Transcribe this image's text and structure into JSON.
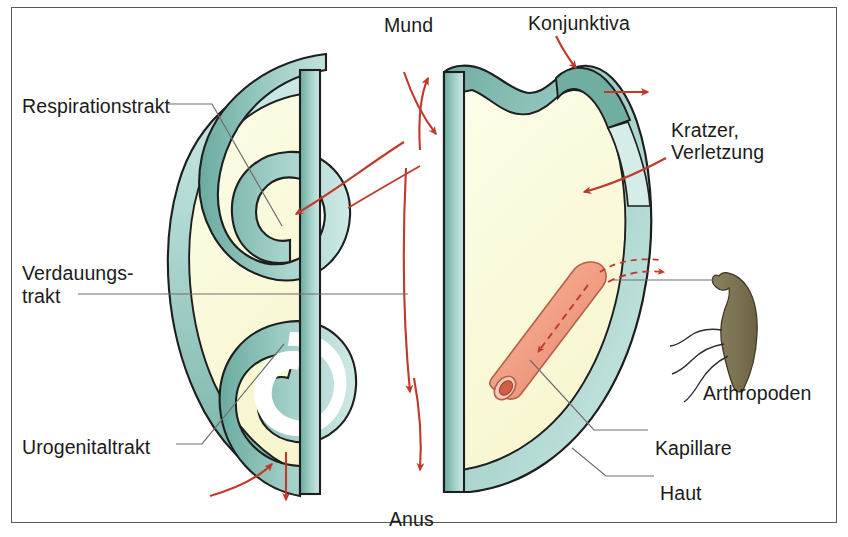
{
  "figure": {
    "type": "anatomical-schematic",
    "background_color": "#ffffff",
    "frame_color": "#58585a"
  },
  "palette": {
    "membrane_light": "#bfe0dc",
    "membrane_mid": "#9ccdc6",
    "membrane_dark": "#6aab9f",
    "body_interior": "#fbfbdc",
    "outline": "#1e1e1e",
    "arrow_red": "#c0392b",
    "capillary_pink": "#f3a289",
    "capillary_dark": "#c9503c",
    "arthropod_body": "#7d7453",
    "leader_line": "#6e6e70",
    "text": "#1b1b1b"
  },
  "labels": {
    "respirationstrakt": {
      "text": "Respirationstrakt",
      "x": 22,
      "y": 95
    },
    "verdauungstrakt_line1": {
      "text": "Verdauungs-",
      "x": 22,
      "y": 262
    },
    "verdauungstrakt_line2": {
      "text": "trakt",
      "x": 22,
      "y": 285
    },
    "urogenitaltrakt": {
      "text": "Urogenitaltrakt",
      "x": 22,
      "y": 436
    },
    "mund": {
      "text": "Mund",
      "x": 384,
      "y": 14
    },
    "konjunktiva": {
      "text": "Konjunktiva",
      "x": 528,
      "y": 12
    },
    "kratzer_line1": {
      "text": "Kratzer,",
      "x": 671,
      "y": 119
    },
    "kratzer_line2": {
      "text": "Verletzung",
      "x": 671,
      "y": 141
    },
    "arthropoden": {
      "text": "Arthropoden",
      "x": 703,
      "y": 382
    },
    "kapillare": {
      "text": "Kapillare",
      "x": 655,
      "y": 437
    },
    "haut": {
      "text": "Haut",
      "x": 660,
      "y": 482
    },
    "anus": {
      "text": "Anus",
      "x": 389,
      "y": 508
    }
  },
  "structures": {
    "left_body": {
      "name": "linke Koerperhaelfte mit inneren Schleimhauttrakten",
      "tracts": [
        "Respirationstrakt",
        "Verdauungstrakt",
        "Urogenitaltrakt"
      ]
    },
    "right_body": {
      "name": "rechte Koerperhaelfte mit Haut",
      "features": [
        "Haut",
        "Konjunktiva",
        "Kapillare",
        "Kratzer/Verletzung"
      ]
    },
    "arthropod": {
      "name": "Arthropoden",
      "legs": 3
    },
    "capillary": {
      "name": "Kapillare",
      "flow": "dashed-arrows"
    }
  },
  "annotations": {
    "entry_arrows": [
      "Mund aufwaerts",
      "Mund abwaerts",
      "Respirationstrakt einwaerts",
      "Anus abwaerts",
      "Urogenitaltrakt einwaerts",
      "Konjunktiva einwaerts",
      "Haut auswaerts",
      "Kratzer einwaerts",
      "Arthropoden zur Kapillare"
    ]
  }
}
